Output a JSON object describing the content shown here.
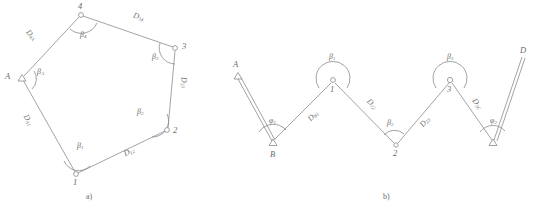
{
  "figure": {
    "title": "",
    "background_color": "#ffffff",
    "line_color": "#8c8c8c",
    "text_color": "#6b6b6b"
  },
  "panel_a": {
    "caption": "a)",
    "type": "closed-polygon-traverse",
    "stations": [
      {
        "id": "A",
        "label": "A",
        "symbol": "triangle-control-point",
        "x": 22,
        "y": 78
      },
      {
        "id": "1",
        "label": "1",
        "symbol": "circle-station",
        "x": 76,
        "y": 174
      },
      {
        "id": "2",
        "label": "2",
        "symbol": "circle-station",
        "x": 167,
        "y": 130
      },
      {
        "id": "3",
        "label": "3",
        "symbol": "circle-station",
        "x": 175,
        "y": 48
      },
      {
        "id": "4",
        "label": "4",
        "symbol": "circle-station",
        "x": 81,
        "y": 15
      }
    ],
    "distances": [
      {
        "label": "D",
        "sub": "4A",
        "x": 30,
        "y": 36
      },
      {
        "label": "D",
        "sub": "34",
        "x": 133,
        "y": 18
      },
      {
        "label": "D",
        "sub": "23",
        "x": 178,
        "y": 82
      },
      {
        "label": "D",
        "sub": "12",
        "x": 126,
        "y": 152
      },
      {
        "label": "D",
        "sub": "A1",
        "x": 24,
        "y": 120
      }
    ],
    "angles": [
      {
        "label": "β",
        "sub": "A",
        "x": 38,
        "y": 70
      },
      {
        "label": "β",
        "sub": "1",
        "x": 78,
        "y": 144
      },
      {
        "label": "β",
        "sub": "2",
        "x": 139,
        "y": 111
      },
      {
        "label": "β",
        "sub": "3",
        "x": 155,
        "y": 56
      },
      {
        "label": "β",
        "sub": "4",
        "x": 82,
        "y": 33
      }
    ]
  },
  "panel_b": {
    "caption": "b)",
    "type": "open-zigzag-traverse",
    "stations": [
      {
        "id": "A",
        "label": "A",
        "symbol": "triangle-control-point",
        "x": 238,
        "y": 76
      },
      {
        "id": "B",
        "label": "B",
        "symbol": "triangle-control-point",
        "x": 273,
        "y": 143
      },
      {
        "id": "1",
        "label": "1",
        "symbol": "circle-station",
        "x": 333,
        "y": 80
      },
      {
        "id": "2",
        "label": "2",
        "symbol": "circle-station",
        "x": 396,
        "y": 145
      },
      {
        "id": "3",
        "label": "3",
        "symbol": "circle-station",
        "x": 450,
        "y": 80
      },
      {
        "id": "C",
        "label": "",
        "symbol": "triangle-control-point",
        "x": 493,
        "y": 143
      },
      {
        "id": "D",
        "label": "D",
        "symbol": "endpoint",
        "x": 524,
        "y": 55
      }
    ],
    "distances": [
      {
        "label": "D",
        "sub": "B1",
        "x": 313,
        "y": 116
      },
      {
        "label": "D",
        "sub": "12",
        "x": 369,
        "y": 104
      },
      {
        "label": "D",
        "sub": "23",
        "x": 423,
        "y": 122
      },
      {
        "label": "D",
        "sub": "3C",
        "x": 474,
        "y": 104
      }
    ],
    "angles": [
      {
        "label": "φ",
        "sub": "1",
        "x": 273,
        "y": 120
      },
      {
        "label": "β",
        "sub": "1",
        "x": 332,
        "y": 57
      },
      {
        "label": "β",
        "sub": "2",
        "x": 390,
        "y": 122
      },
      {
        "label": "β",
        "sub": "3",
        "x": 450,
        "y": 57
      },
      {
        "label": "φ",
        "sub": "2",
        "x": 493,
        "y": 120
      }
    ]
  }
}
